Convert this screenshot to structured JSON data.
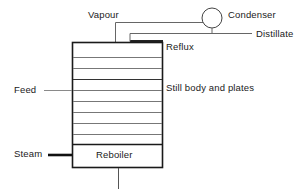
{
  "diagram": {
    "colors": {
      "stroke_dark": "#1a1a1a",
      "stroke_mid": "#555555",
      "stroke_light": "#888888",
      "text": "#1a1a1a",
      "background": "#ffffff"
    },
    "labels": {
      "vapour": "Vapour",
      "condenser": "Condenser",
      "distillate": "Distillate",
      "reflux": "Reflux",
      "still_body": "Still body and plates",
      "feed": "Feed",
      "steam": "Steam",
      "reboiler": "Reboiler"
    },
    "components": {
      "column": {
        "name": "Still body and plates",
        "x": 72,
        "y": 42,
        "width": 91,
        "height": 126,
        "plate_count": 8
      },
      "condenser": {
        "name": "Condenser",
        "cx": 212,
        "cy": 18,
        "r": 10
      },
      "reboiler": {
        "name": "Reboiler",
        "x": 72,
        "y": 144,
        "width": 91,
        "height": 24
      }
    },
    "streams": [
      {
        "name": "vapour",
        "label": "Vapour",
        "direction": "column-top to condenser"
      },
      {
        "name": "reflux",
        "label": "Reflux",
        "direction": "condenser to column-top"
      },
      {
        "name": "distillate",
        "label": "Distillate",
        "direction": "condenser to right"
      },
      {
        "name": "feed",
        "label": "Feed",
        "direction": "left to column-mid"
      },
      {
        "name": "steam",
        "label": "Steam",
        "direction": "left to reboiler"
      },
      {
        "name": "bottoms",
        "label": "",
        "direction": "reboiler downward"
      }
    ]
  }
}
